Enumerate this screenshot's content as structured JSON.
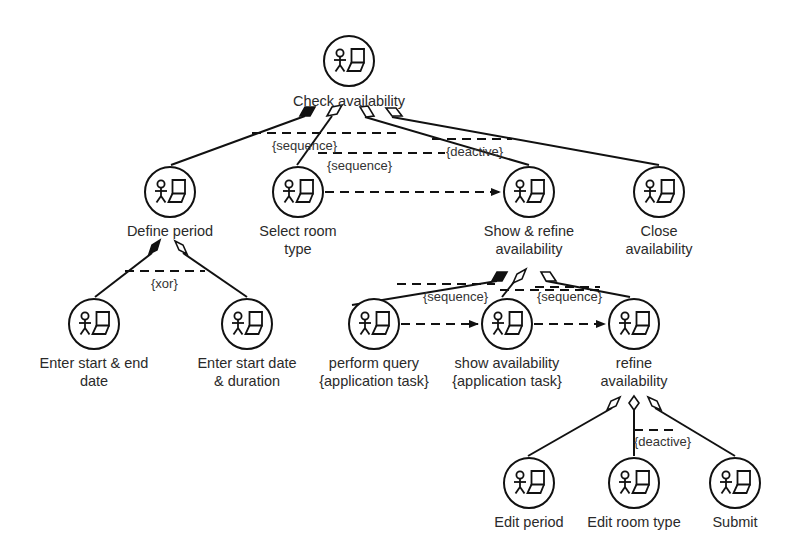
{
  "diagram": {
    "type": "task-tree",
    "nodes": [
      {
        "id": "check",
        "label": "Check availability",
        "x": 349,
        "y": 61,
        "lines": [
          "Check availability"
        ]
      },
      {
        "id": "define",
        "label": "Define period",
        "x": 170,
        "y": 192,
        "lines": [
          "Define period"
        ]
      },
      {
        "id": "select",
        "label": "Select room type",
        "x": 298,
        "y": 192,
        "lines": [
          "Select room",
          "type"
        ]
      },
      {
        "id": "showrefine",
        "label": "Show & refine availability",
        "x": 529,
        "y": 192,
        "lines": [
          "Show & refine",
          "availability"
        ]
      },
      {
        "id": "close",
        "label": "Close availability",
        "x": 659,
        "y": 192,
        "lines": [
          "Close",
          "availability"
        ]
      },
      {
        "id": "enterend",
        "label": "Enter start & end date",
        "x": 94,
        "y": 324,
        "lines": [
          "Enter start & end",
          "date"
        ]
      },
      {
        "id": "enterdur",
        "label": "Enter start date & duration",
        "x": 247,
        "y": 324,
        "lines": [
          "Enter start date",
          "& duration"
        ]
      },
      {
        "id": "query",
        "label": "perform query {application task}",
        "x": 374,
        "y": 324,
        "lines": [
          "perform query",
          "{application task}"
        ]
      },
      {
        "id": "showavail",
        "label": "show availability {application task}",
        "x": 507,
        "y": 324,
        "lines": [
          "show availability",
          "{application task}"
        ]
      },
      {
        "id": "refine",
        "label": "refine availability",
        "x": 634,
        "y": 324,
        "lines": [
          "refine",
          "availability"
        ]
      },
      {
        "id": "editperiod",
        "label": "Edit period",
        "x": 529,
        "y": 483,
        "lines": [
          "Edit period"
        ]
      },
      {
        "id": "editroom",
        "label": "Edit room type",
        "x": 634,
        "y": 483,
        "lines": [
          "Edit room type"
        ]
      },
      {
        "id": "submit",
        "label": "Submit",
        "x": 735,
        "y": 483,
        "lines": [
          "Submit"
        ]
      }
    ],
    "constraints": [
      {
        "id": "c1",
        "text": "{sequence}",
        "x": 272,
        "y": 138
      },
      {
        "id": "c2",
        "text": "{sequence}",
        "x": 327,
        "y": 158
      },
      {
        "id": "c3",
        "text": "{deactive}",
        "x": 446,
        "y": 144
      },
      {
        "id": "c4",
        "text": "{xor}",
        "x": 151,
        "y": 277
      },
      {
        "id": "c5",
        "text": "{sequence}",
        "x": 423,
        "y": 290
      },
      {
        "id": "c6",
        "text": "{sequence}",
        "x": 537,
        "y": 290
      },
      {
        "id": "c7",
        "text": "{deactive}",
        "x": 634,
        "y": 435
      }
    ],
    "edges": [
      {
        "from": "check",
        "to": "define"
      },
      {
        "from": "check",
        "to": "select"
      },
      {
        "from": "check",
        "to": "showrefine"
      },
      {
        "from": "check",
        "to": "close"
      },
      {
        "from": "define",
        "to": "enterend"
      },
      {
        "from": "define",
        "to": "enterdur"
      },
      {
        "from": "showrefine",
        "to": "query"
      },
      {
        "from": "showrefine",
        "to": "showavail"
      },
      {
        "from": "showrefine",
        "to": "refine"
      },
      {
        "from": "refine",
        "to": "editperiod"
      },
      {
        "from": "refine",
        "to": "editroom"
      },
      {
        "from": "refine",
        "to": "submit"
      }
    ],
    "flows": [
      {
        "from": "select",
        "to": "showrefine",
        "style": "dashed-arrow"
      },
      {
        "from": "query",
        "to": "showavail",
        "style": "dashed-arrow"
      },
      {
        "from": "showavail",
        "to": "refine",
        "style": "dashed-arrow"
      }
    ]
  },
  "labels": {
    "check_0": "Check availability",
    "define_0": "Define period",
    "select_0": "Select room",
    "select_1": "type",
    "showrefine_0": "Show & refine",
    "showrefine_1": "availability",
    "close_0": "Close",
    "close_1": "availability",
    "enterend_0": "Enter start & end",
    "enterend_1": "date",
    "enterdur_0": "Enter start date",
    "enterdur_1": "& duration",
    "query_0": "perform query",
    "query_1": "{application task}",
    "showavail_0": "show availability",
    "showavail_1": "{application task}",
    "refine_0": "refine",
    "refine_1": "availability",
    "editperiod_0": "Edit period",
    "editroom_0": "Edit room type",
    "submit_0": "Submit"
  },
  "constraint_text": {
    "c1": "{sequence}",
    "c2": "{sequence}",
    "c3": "{deactive}",
    "c4": "{xor}",
    "c5": "{sequence}",
    "c6": "{sequence}",
    "c7": "{deactive}"
  }
}
